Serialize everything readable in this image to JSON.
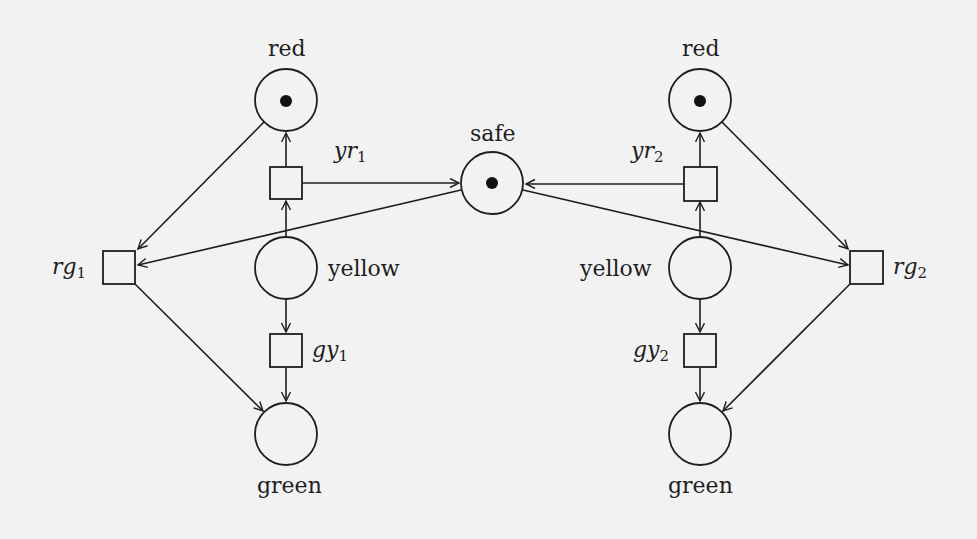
{
  "diagram": {
    "type": "petri-net",
    "colors": {
      "stroke": "#1e1e1e",
      "token": "#111111",
      "background": "#f2f2f2"
    },
    "places": [
      {
        "id": "red1",
        "label": "red",
        "x": 286,
        "y": 100,
        "tokens": 1
      },
      {
        "id": "yellow1",
        "label": "yellow",
        "x": 286,
        "y": 268,
        "tokens": 0
      },
      {
        "id": "green1",
        "label": "green",
        "x": 286,
        "y": 434,
        "tokens": 0
      },
      {
        "id": "safe",
        "label": "safe",
        "x": 492,
        "y": 183,
        "tokens": 1
      },
      {
        "id": "red2",
        "label": "red",
        "x": 700,
        "y": 100,
        "tokens": 1
      },
      {
        "id": "yellow2",
        "label": "yellow",
        "x": 700,
        "y": 268,
        "tokens": 0
      },
      {
        "id": "green2",
        "label": "green",
        "x": 700,
        "y": 434,
        "tokens": 0
      }
    ],
    "transitions": [
      {
        "id": "yr1",
        "name": "yr",
        "sub": "1",
        "x": 286,
        "y": 183
      },
      {
        "id": "gy1",
        "name": "gy",
        "sub": "1",
        "x": 286,
        "y": 350
      },
      {
        "id": "rg1",
        "name": "rg",
        "sub": "1",
        "x": 119,
        "y": 267
      },
      {
        "id": "yr2",
        "name": "yr",
        "sub": "2",
        "x": 700,
        "y": 184
      },
      {
        "id": "gy2",
        "name": "gy",
        "sub": "2",
        "x": 700,
        "y": 350
      },
      {
        "id": "rg2",
        "name": "rg",
        "sub": "2",
        "x": 866,
        "y": 267
      }
    ],
    "arcs": [
      {
        "from": "red1",
        "to": "rg1"
      },
      {
        "from": "safe",
        "to": "rg1"
      },
      {
        "from": "rg1",
        "to": "green1"
      },
      {
        "from": "green1",
        "to": "gy1"
      },
      {
        "from": "gy1",
        "to": "yellow1"
      },
      {
        "from": "yellow1",
        "to": "yr1"
      },
      {
        "from": "yr1",
        "to": "red1"
      },
      {
        "from": "yr1",
        "to": "safe"
      },
      {
        "from": "red2",
        "to": "rg2"
      },
      {
        "from": "safe",
        "to": "rg2"
      },
      {
        "from": "rg2",
        "to": "green2"
      },
      {
        "from": "green2",
        "to": "gy2"
      },
      {
        "from": "gy2",
        "to": "yellow2"
      },
      {
        "from": "yellow2",
        "to": "yr2"
      },
      {
        "from": "yr2",
        "to": "red2"
      },
      {
        "from": "yr2",
        "to": "safe"
      }
    ]
  },
  "labels": {
    "red1": "red",
    "red2": "red",
    "safe": "safe",
    "yellow1": "yellow",
    "yellow2": "yellow",
    "green1": "green",
    "green2": "green",
    "yr1": {
      "name": "yr",
      "sub": "1"
    },
    "yr2": {
      "name": "yr",
      "sub": "2"
    },
    "gy1": {
      "name": "gy",
      "sub": "1"
    },
    "gy2": {
      "name": "gy",
      "sub": "2"
    },
    "rg1": {
      "name": "rg",
      "sub": "1"
    },
    "rg2": {
      "name": "rg",
      "sub": "2"
    }
  }
}
